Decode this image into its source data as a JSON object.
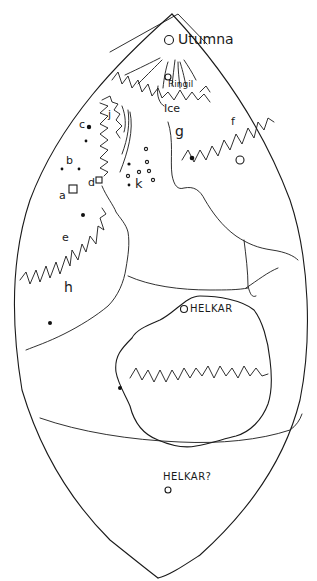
{
  "map": {
    "title": "Hand-drawn map of the world",
    "ink_color": "#1a1a1a",
    "paper_color": "#ffffff",
    "labels": {
      "utumna": "Utumna",
      "ringil": "Ringil",
      "ice": "Ice",
      "g": "g",
      "f": "f",
      "c": "c",
      "b": "b",
      "a": "a",
      "d": "d",
      "j": "j",
      "k": "k",
      "e": "e",
      "h": "h",
      "helkar": "HELKAR",
      "helkar_query": "HELKAR?"
    },
    "symbols": {
      "utumna_marker": "circle",
      "ringil_marker": "circle",
      "helkar_marker": "circle",
      "helkar_query_marker": "circle",
      "east_marker": "circle",
      "a_marker": "square",
      "d_marker": "square"
    }
  }
}
